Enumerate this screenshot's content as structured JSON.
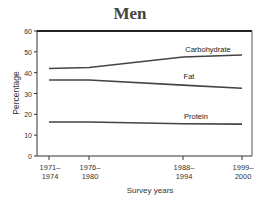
{
  "chart_data": {
    "type": "line",
    "title": "Men",
    "xlabel": "Survey years",
    "ylabel": "Percentage",
    "ylim": [
      0,
      60
    ],
    "yticks": [
      0,
      10,
      20,
      30,
      40,
      50,
      60
    ],
    "categories": [
      "1971–1974",
      "1976–1980",
      "1988–1994",
      "1999–2000"
    ],
    "x_tick_lines": [
      [
        "1971–",
        "1974"
      ],
      [
        "1976–",
        "1980"
      ],
      [
        "1988–",
        "1994"
      ],
      [
        "1999–",
        "2000"
      ]
    ],
    "series": [
      {
        "name": "Carbohydrate",
        "values": [
          42,
          42.5,
          47.5,
          48.5
        ]
      },
      {
        "name": "Fat",
        "values": [
          36.5,
          36.5,
          34,
          32.5
        ]
      },
      {
        "name": "Protein",
        "values": [
          16.3,
          16.3,
          15.5,
          15.3
        ]
      }
    ],
    "grid": false,
    "legend": "inline labels"
  }
}
